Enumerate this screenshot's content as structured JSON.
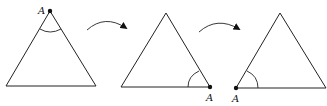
{
  "diagram": {
    "stroke_color": "#222222",
    "triangles": [
      {
        "id": 1,
        "vertex_label": "A",
        "vertex_position": "top"
      },
      {
        "id": 2,
        "vertex_label": "A",
        "vertex_position": "bottom-right"
      },
      {
        "id": 3,
        "vertex_label": "A",
        "vertex_position": "bottom-left"
      }
    ],
    "arrows": [
      {
        "from": 1,
        "to": 2,
        "shape": "curved"
      },
      {
        "from": 2,
        "to": 3,
        "shape": "curved"
      }
    ]
  }
}
